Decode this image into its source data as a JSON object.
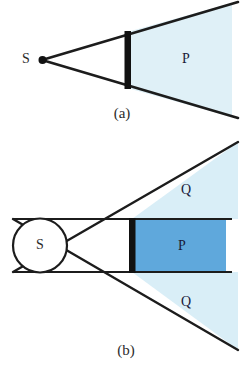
{
  "figure": {
    "type": "optics-shadow-diagram",
    "background_color": "#ffffff",
    "line_color": "#1c1c1c",
    "panels": [
      {
        "id": "a",
        "caption": "(a)",
        "source": {
          "label": "S",
          "kind": "point-source",
          "x": 42,
          "y": 60
        },
        "aperture_bar": {
          "color": "#111111",
          "x": 125,
          "y_top": 32,
          "y_bottom": 89
        },
        "regions": [
          {
            "label": "P",
            "kind": "umbra",
            "fill": "#dff0f7",
            "label_x": 186,
            "label_y": 60
          }
        ]
      },
      {
        "id": "b",
        "caption": "(b)",
        "source": {
          "label": "S",
          "kind": "extended-circular-source",
          "cx": 40,
          "cy": 245,
          "r": 27
        },
        "aperture_bar": {
          "color": "#111111",
          "x": 132,
          "y_top": 219,
          "y_bottom": 272
        },
        "regions": [
          {
            "label": "P",
            "kind": "umbra",
            "fill": "#5fa8dc",
            "label_x": 182,
            "label_y": 246
          },
          {
            "label": "Q",
            "kind": "penumbra-upper",
            "fill": "#d9eef7",
            "label_x": 186,
            "label_y": 191
          },
          {
            "label": "Q",
            "kind": "penumbra-lower",
            "fill": "#d9eef7",
            "label_x": 186,
            "label_y": 303
          }
        ]
      }
    ]
  },
  "bottom_caption": {
    "text": "",
    "visible": "partial"
  }
}
